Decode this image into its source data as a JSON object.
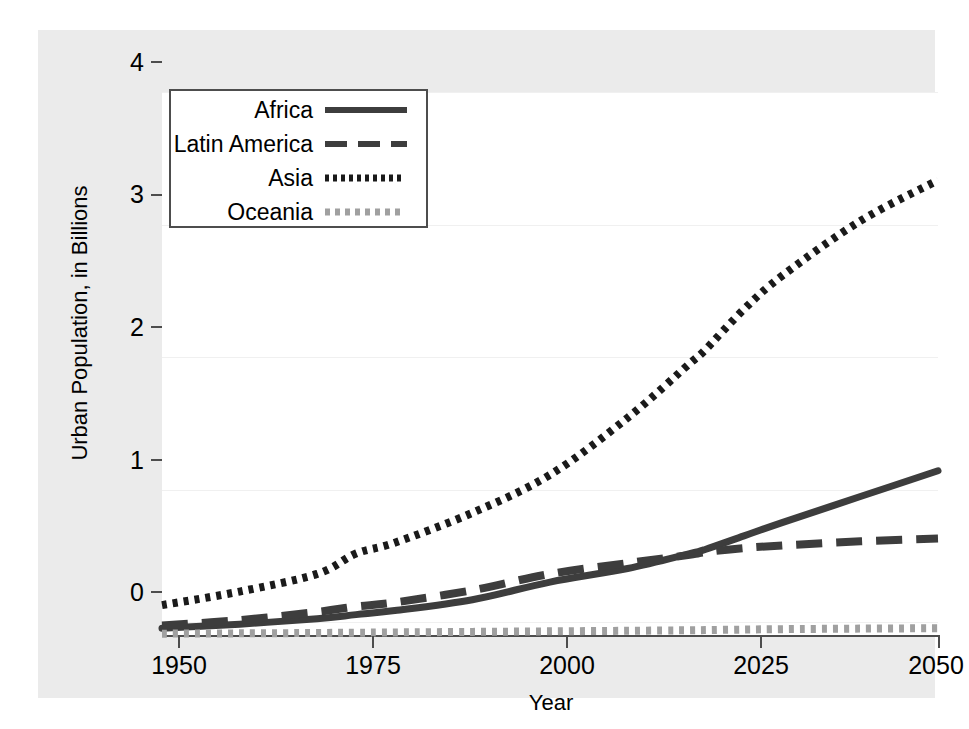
{
  "chart_data": {
    "type": "line",
    "title": "",
    "xlabel": "Year",
    "ylabel": "Urban Population, in Billions",
    "xlim": [
      1950,
      2050
    ],
    "ylim": [
      0,
      4
    ],
    "xticks": [
      "1950",
      "1975",
      "2000",
      "2025",
      "2050"
    ],
    "xtick_values": [
      1950,
      1975,
      2000,
      2025,
      2050
    ],
    "yticks": [
      "0",
      "1",
      "2",
      "3",
      "4"
    ],
    "ytick_values": [
      0,
      1,
      2,
      3,
      4
    ],
    "grid": "horizontal-faint",
    "legend_position": "upper-left-inside",
    "x": [
      1950,
      1960,
      1970,
      1975,
      1980,
      1990,
      2000,
      2010,
      2018,
      2020,
      2025,
      2030,
      2040,
      2050
    ],
    "series": [
      {
        "name": "Africa",
        "style": "solid",
        "color": "#3d3d3d",
        "values": [
          0.05,
          0.08,
          0.12,
          0.15,
          0.18,
          0.26,
          0.39,
          0.49,
          0.6,
          0.63,
          0.73,
          0.83,
          1.02,
          1.21
        ]
      },
      {
        "name": "Latin America",
        "style": "dashed",
        "color": "#3d3d3d",
        "values": [
          0.07,
          0.11,
          0.17,
          0.21,
          0.24,
          0.33,
          0.45,
          0.53,
          0.59,
          0.61,
          0.64,
          0.66,
          0.69,
          0.71
        ]
      },
      {
        "name": "Asia",
        "style": "dotted",
        "color": "#1a1a1a",
        "values": [
          0.22,
          0.32,
          0.45,
          0.6,
          0.68,
          0.9,
          1.18,
          1.6,
          2.0,
          2.1,
          2.4,
          2.65,
          3.05,
          3.35
        ]
      },
      {
        "name": "Oceania",
        "style": "dotted",
        "color": "#a0a0a0",
        "values": [
          0.01,
          0.012,
          0.015,
          0.017,
          0.019,
          0.023,
          0.027,
          0.031,
          0.035,
          0.036,
          0.04,
          0.043,
          0.047,
          0.05
        ]
      }
    ]
  },
  "legend": {
    "items": [
      {
        "label": "Africa"
      },
      {
        "label": "Latin America"
      },
      {
        "label": "Asia"
      },
      {
        "label": "Oceania"
      }
    ]
  },
  "axes": {
    "y_title": "Urban Population, in Billions",
    "x_title": "Year",
    "y_tick_labels": [
      "0",
      "1",
      "2",
      "3",
      "4"
    ],
    "x_tick_labels": [
      "1950",
      "1975",
      "2000",
      "2025",
      "2050"
    ]
  },
  "colors": {
    "figure_background": "#ebebeb",
    "plot_background": "#ffffff",
    "axis": "#4d4d4d",
    "gridline": "#f0f0f0",
    "dark_series": "#3d3d3d",
    "asia_series": "#1a1a1a",
    "oceania_series": "#a0a0a0"
  }
}
